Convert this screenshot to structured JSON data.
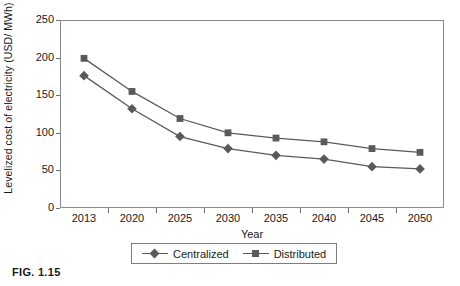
{
  "caption": "FIG. 1.15",
  "chart_data": {
    "type": "line",
    "title": "",
    "xlabel": "Year",
    "ylabel": "Levelized cost of electricity (USD/ MWh)",
    "categories": [
      "2013",
      "2020",
      "2025",
      "2030",
      "2035",
      "2040",
      "2045",
      "2050"
    ],
    "x": [
      2013,
      2020,
      2025,
      2030,
      2035,
      2040,
      2045,
      2050
    ],
    "ylim": [
      0,
      250
    ],
    "yticks": [
      0,
      50,
      100,
      150,
      200,
      250
    ],
    "grid": false,
    "legend_position": "below-axes",
    "series": [
      {
        "name": "Centralized",
        "marker": "diamond",
        "color": "#5a5a5a",
        "values": [
          176,
          132,
          95,
          79,
          70,
          65,
          55,
          52
        ]
      },
      {
        "name": "Distributed",
        "marker": "square",
        "color": "#5a5a5a",
        "values": [
          199,
          155,
          119,
          100,
          93,
          88,
          79,
          74
        ]
      }
    ]
  },
  "colors": {
    "line": "#5a5a5a",
    "frame": "#8a8a8a",
    "tick": "#6f6f6f",
    "text": "#1a1a1a"
  }
}
